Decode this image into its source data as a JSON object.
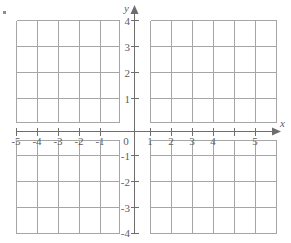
{
  "figure": {
    "kind": "cartesian-coordinate-grid",
    "background_color": "#ffffff",
    "grid_line_color": "#a6a6a6",
    "axis_line_color": "#6e6e6e",
    "label_color": "#5e5e5e"
  },
  "axes": {
    "x": {
      "name": "x",
      "min": -5,
      "max": 5,
      "step": 1,
      "tick_labels": [
        "-5",
        "-4",
        "-3",
        "-2",
        "-1",
        "0",
        "1",
        "2",
        "3",
        "4",
        "5"
      ],
      "arrow": "right"
    },
    "y": {
      "name": "y",
      "min": -4,
      "max": 4,
      "step": 1,
      "tick_labels": [
        "4",
        "3",
        "2",
        "1",
        "-1",
        "-2",
        "-3",
        "-4"
      ],
      "arrow": "up"
    }
  },
  "origin_label": "0",
  "marks": {
    "corner_dot": "bullet-mark"
  }
}
